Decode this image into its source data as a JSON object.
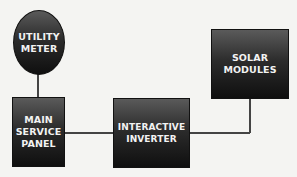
{
  "diagram": {
    "nodes": [
      {
        "id": "utility-meter",
        "label_lines": [
          "UTILITY",
          "METER"
        ],
        "shape": "ellipse"
      },
      {
        "id": "main-service-panel",
        "label_lines": [
          "MAIN",
          "SERVICE",
          "PANEL"
        ],
        "shape": "rectangle"
      },
      {
        "id": "interactive-inverter",
        "label_lines": [
          "INTERACTIVE",
          "INVERTER"
        ],
        "shape": "rectangle"
      },
      {
        "id": "solar-modules",
        "label_lines": [
          "SOLAR",
          "MODULES"
        ],
        "shape": "rectangle"
      }
    ],
    "edges": [
      {
        "from": "utility-meter",
        "to": "main-service-panel"
      },
      {
        "from": "main-service-panel",
        "to": "interactive-inverter"
      },
      {
        "from": "interactive-inverter",
        "to": "solar-modules"
      }
    ],
    "colors": {
      "node_fill_top": "#5a5a5a",
      "node_fill_bottom": "#0f0f0f",
      "text": "#f2f2f2",
      "line": "#444444",
      "background": "#f4f4f2"
    }
  }
}
